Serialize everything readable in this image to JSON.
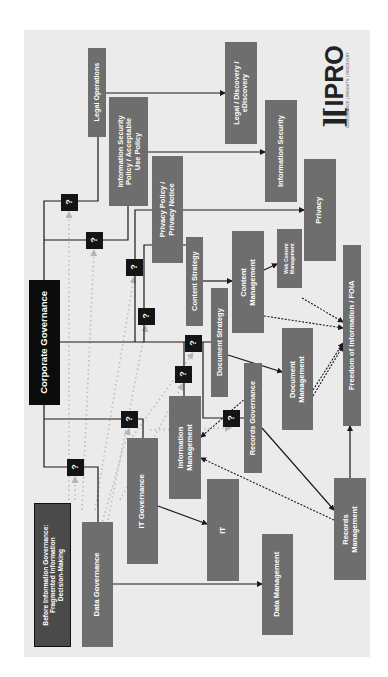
{
  "diagram": {
    "title": "Before Information Governance:\nFragmented Information\nDecision-Making",
    "orientation": "rotated 90° counter-clockwise",
    "root": "Corporate Governance",
    "unknown_marker": "?",
    "logo": {
      "mark": "][",
      "name": "IPRO",
      "tagline": "GOVERNANCE | INSIGHTS | DISCOVERY"
    },
    "colors": {
      "panel": "#ebebeb",
      "box": "#6e6e6e",
      "root_box": "#0c0c0c",
      "title_box": "#4a4a4a",
      "question_box": "#141414",
      "line": "#1a1a1a",
      "dotted_gray": "#bdbdbd"
    },
    "nodes": [
      {
        "id": "corporate_governance",
        "label": "Corporate Governance",
        "style": "black",
        "x": 29,
        "y": 280,
        "w": 31,
        "h": 125,
        "fs": 9.5
      },
      {
        "id": "title",
        "label": "Before Information Governance:\nFragmented Information\nDecision-Making",
        "style": "title",
        "x": 34,
        "y": 503,
        "w": 37,
        "h": 144,
        "fs": 6.6
      },
      {
        "id": "legal_operations",
        "label": "Legal Operations",
        "style": "gray",
        "x": 88,
        "y": 48,
        "w": 18,
        "h": 89,
        "fs": 7.2
      },
      {
        "id": "infosec_policy",
        "label": "Information Security\nPolicy / Acceptable\nUse Policy",
        "style": "gray",
        "x": 109,
        "y": 97,
        "w": 39,
        "h": 109,
        "fs": 7.4
      },
      {
        "id": "privacy_policy",
        "label": "Privacy Policy /\nPrivacy Notice",
        "style": "gray",
        "x": 152,
        "y": 156,
        "w": 31,
        "h": 107,
        "fs": 7.6
      },
      {
        "id": "legal_discovery",
        "label": "Legal / Discovery /\neDiscovery",
        "style": "gray",
        "x": 225,
        "y": 42,
        "w": 32,
        "h": 102,
        "fs": 7.2
      },
      {
        "id": "information_security",
        "label": "Information Security",
        "style": "gray",
        "x": 265,
        "y": 100,
        "w": 32,
        "h": 102,
        "fs": 7.4
      },
      {
        "id": "privacy",
        "label": "Privacy",
        "style": "gray",
        "x": 304,
        "y": 159,
        "w": 32,
        "h": 102,
        "fs": 7.6
      },
      {
        "id": "content_strategy",
        "label": "Content Strategy",
        "style": "gray",
        "x": 186,
        "y": 237,
        "w": 17,
        "h": 89,
        "fs": 7.4
      },
      {
        "id": "content_management",
        "label": "Content\nManagement",
        "style": "gray",
        "x": 232,
        "y": 231,
        "w": 32,
        "h": 102,
        "fs": 7.6
      },
      {
        "id": "web_content_management",
        "label": "Web Content\nManagement",
        "style": "gray",
        "x": 277,
        "y": 229,
        "w": 25,
        "h": 59,
        "fs": 5
      },
      {
        "id": "document_strategy",
        "label": "Document Strategy",
        "style": "gray",
        "x": 211,
        "y": 288,
        "w": 17,
        "h": 109,
        "fs": 7.4
      },
      {
        "id": "document_management",
        "label": "Document\nManagement",
        "style": "gray",
        "x": 282,
        "y": 328,
        "w": 31,
        "h": 102,
        "fs": 7.6
      },
      {
        "id": "foia",
        "label": "Freedom of Information / FOIA",
        "style": "gray",
        "x": 343,
        "y": 245,
        "w": 18,
        "h": 181,
        "fs": 7.6
      },
      {
        "id": "records_governance",
        "label": "Records Governance",
        "style": "gray",
        "x": 244,
        "y": 363,
        "w": 18,
        "h": 110,
        "fs": 7.4
      },
      {
        "id": "information_management",
        "label": "Information\nManagement",
        "style": "gray",
        "x": 169,
        "y": 396,
        "w": 32,
        "h": 103,
        "fs": 7.6
      },
      {
        "id": "it_governance",
        "label": "IT Governance",
        "style": "gray",
        "x": 127,
        "y": 438,
        "w": 31,
        "h": 126,
        "fs": 7.8
      },
      {
        "id": "data_governance",
        "label": "Data Governance",
        "style": "gray",
        "x": 82,
        "y": 522,
        "w": 31,
        "h": 125,
        "fs": 7.8
      },
      {
        "id": "it",
        "label": "IT",
        "style": "gray",
        "x": 207,
        "y": 479,
        "w": 32,
        "h": 102,
        "fs": 7.8
      },
      {
        "id": "data_management",
        "label": "Data Management",
        "style": "gray",
        "x": 262,
        "y": 534,
        "w": 31,
        "h": 101,
        "fs": 7.6
      },
      {
        "id": "records_management",
        "label": "Records\nManagement",
        "style": "gray",
        "x": 334,
        "y": 478,
        "w": 32,
        "h": 102,
        "fs": 7.6
      }
    ],
    "question_markers": [
      {
        "id": "q_legal_operations",
        "label": "?",
        "cx": 69,
        "cy": 202
      },
      {
        "id": "q_infosec_policy",
        "label": "?",
        "cx": 94,
        "cy": 240
      },
      {
        "id": "q_privacy_policy",
        "label": "?",
        "cx": 134,
        "cy": 267
      },
      {
        "id": "q_content_strategy",
        "label": "?",
        "cx": 146,
        "cy": 316
      },
      {
        "id": "q_document_strategy",
        "label": "?",
        "cx": 193,
        "cy": 343
      },
      {
        "id": "q_information_management",
        "label": "?",
        "cx": 183,
        "cy": 374
      },
      {
        "id": "q_records_governance",
        "label": "?",
        "cx": 231,
        "cy": 418
      },
      {
        "id": "q_it_governance",
        "label": "?",
        "cx": 129,
        "cy": 419
      },
      {
        "id": "q_data_governance",
        "label": "?",
        "cx": 75,
        "cy": 467
      }
    ],
    "solid_lines": [
      [
        [
          44,
          280
        ],
        [
          44,
          201
        ],
        [
          98,
          201
        ],
        [
          98,
          137
        ]
      ],
      [
        [
          44,
          240
        ],
        [
          128,
          240
        ],
        [
          128,
          206
        ]
      ],
      [
        [
          44,
          405
        ],
        [
          44,
          467
        ],
        [
          98,
          467
        ],
        [
          98,
          522
        ]
      ],
      [
        [
          44,
          419
        ],
        [
          143,
          419
        ],
        [
          143,
          438
        ]
      ],
      [
        [
          60,
          342
        ],
        [
          211,
          342
        ]
      ],
      [
        [
          135,
          342
        ],
        [
          135,
          210
        ],
        [
          152,
          210
        ]
      ],
      [
        [
          144,
          342
        ],
        [
          144,
          245
        ],
        [
          186,
          245
        ]
      ],
      [
        [
          184,
          342
        ],
        [
          184,
          396
        ]
      ],
      [
        [
          203,
          342
        ],
        [
          203,
          418
        ],
        [
          244,
          418
        ]
      ]
    ],
    "arrows": [
      [
        [
          106,
          93
        ],
        [
          225,
          93
        ]
      ],
      [
        [
          148,
          152
        ],
        [
          265,
          152
        ]
      ],
      [
        [
          183,
          210
        ],
        [
          304,
          210
        ]
      ],
      [
        [
          203,
          281
        ],
        [
          232,
          281
        ]
      ],
      [
        [
          228,
          355
        ],
        [
          282,
          372
        ]
      ],
      [
        [
          264,
          270
        ],
        [
          277,
          264
        ]
      ],
      [
        [
          158,
          506
        ],
        [
          207,
          524
        ]
      ],
      [
        [
          113,
          584
        ],
        [
          262,
          584
        ]
      ],
      [
        [
          262,
          428
        ],
        [
          334,
          510
        ]
      ],
      [
        [
          350,
          478
        ],
        [
          350,
          426
        ]
      ]
    ],
    "dotted_arrows": [
      [
        [
          264,
          316
        ],
        [
          343,
          328
        ]
      ],
      [
        [
          302,
          298
        ],
        [
          343,
          322
        ]
      ],
      [
        [
          313,
          390
        ],
        [
          343,
          343
        ]
      ],
      [
        [
          313,
          396
        ],
        [
          343,
          346
        ]
      ],
      [
        [
          262,
          384
        ],
        [
          201,
          437
        ]
      ],
      [
        [
          334,
          520
        ],
        [
          201,
          458
        ]
      ]
    ],
    "gray_dotted_arrows": [
      [
        [
          69,
          500
        ],
        [
          69,
          212
        ]
      ],
      [
        [
          82,
          510
        ],
        [
          94,
          250
        ]
      ],
      [
        [
          95,
          510
        ],
        [
          134,
          277
        ]
      ],
      [
        [
          108,
          520
        ],
        [
          146,
          326
        ]
      ],
      [
        [
          120,
          500
        ],
        [
          183,
          384
        ]
      ],
      [
        [
          130,
          440
        ],
        [
          193,
          353
        ]
      ],
      [
        [
          150,
          430
        ],
        [
          231,
          428
        ]
      ],
      [
        [
          100,
          530
        ],
        [
          129,
          429
        ]
      ],
      [
        [
          75,
          500
        ],
        [
          75,
          477
        ]
      ]
    ]
  }
}
